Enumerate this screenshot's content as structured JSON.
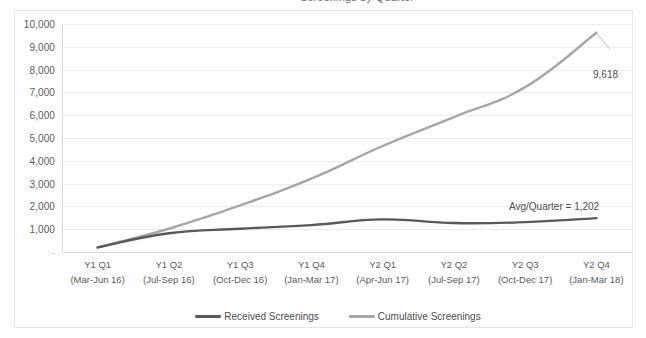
{
  "title_sliver": "Screenings by Quarter",
  "chart_data": {
    "type": "line",
    "title": "",
    "xlabel": "",
    "ylabel": "",
    "ylim": [
      0,
      10000
    ],
    "ytick_step": 1000,
    "grid": true,
    "legend_position": "bottom",
    "categories": [
      "Y1 Q1",
      "Y1 Q2",
      "Y1 Q3",
      "Y1 Q4",
      "Y2 Q1",
      "Y2 Q2",
      "Y2 Q3",
      "Y2 Q4"
    ],
    "category_sublabels": [
      "(Mar-Jun 16)",
      "(Jul-Sep 16)",
      "(Oct-Dec 16)",
      "(Jan-Mar 17)",
      "(Apr-Jun 17)",
      "(Jul-Sep 17)",
      "(Oct-Dec 17)",
      "(Jan-Mar 18)"
    ],
    "ytick_labels": [
      "10,000",
      "9,000",
      "8,000",
      "7,000",
      "6,000",
      "5,000",
      "4,000",
      "3,000",
      "2,000",
      "1,000",
      "-"
    ],
    "ytick_values": [
      10000,
      9000,
      8000,
      7000,
      6000,
      5000,
      4000,
      3000,
      2000,
      1000,
      0
    ],
    "series": [
      {
        "name": "Received Screenings",
        "color": "#595959",
        "values": [
          200,
          820,
          1020,
          1180,
          1430,
          1270,
          1310,
          1485
        ]
      },
      {
        "name": "Cumulative Screenings",
        "color": "#a6a6a6",
        "values": [
          200,
          1020,
          2040,
          3220,
          4650,
          5920,
          7230,
          9618
        ]
      }
    ],
    "annotations": [
      {
        "id": "peak-label",
        "text": "9,618",
        "series": "Cumulative Screenings",
        "category": "Y2 Q4",
        "value": 9618
      },
      {
        "id": "average-note",
        "text": "Avg/Quarter = 1,202",
        "value": 1202
      }
    ]
  },
  "legend": {
    "items": [
      {
        "label": "Received Screenings",
        "color": "#595959"
      },
      {
        "label": "Cumulative Screenings",
        "color": "#a6a6a6"
      }
    ]
  }
}
